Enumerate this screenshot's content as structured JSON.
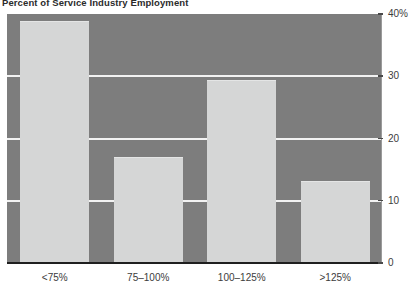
{
  "chart_data": {
    "type": "bar",
    "title": "Percent of Service Industry Employment",
    "xlabel": "",
    "ylabel": "",
    "categories": [
      "<75%",
      "75–100%",
      "100–125%",
      ">125%"
    ],
    "values": [
      38.9,
      17.1,
      29.4,
      13.2
    ],
    "ylim": [
      0,
      40
    ],
    "yticks": [
      0,
      10,
      20,
      30,
      40
    ],
    "ytick_labels": [
      "0",
      "10",
      "20",
      "30",
      "40%"
    ],
    "y_axis_position": "right",
    "grid": true,
    "gridline_color": "#f2f2f2",
    "legend": null,
    "colors": {
      "bar_fill": "#d5d6d6",
      "bar_edge": "#e4e5e5",
      "plot_background": "#7d7d7d",
      "figure_background": "#ffffff",
      "axis_line": "#1f1f1f",
      "tick_label": "#3c3c3c",
      "title": "#2b2b2b"
    }
  }
}
